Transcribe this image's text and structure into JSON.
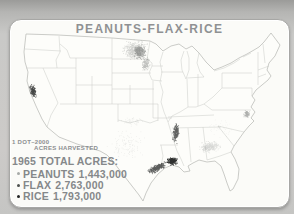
{
  "card": {
    "title": "PEANUTS-FLAX-RICE"
  },
  "legend": {
    "scale_line1": "1 DOT–2000",
    "scale_line2": "ACRES HARVESTED",
    "heading": "1965 TOTAL ACRES:",
    "items": [
      {
        "crop": "PEANUTS",
        "acres": "1,443,000",
        "bullet_color": "#a7aaa8"
      },
      {
        "crop": "FLAX",
        "acres": "2,763,000",
        "bullet_color": "#4e514f"
      },
      {
        "crop": "RICE",
        "acres": "1,793,000",
        "bullet_color": "#222423"
      }
    ]
  },
  "colors": {
    "background": "#c9c9c7",
    "card": "#fbfbf8",
    "card_border": "#a7a7a5",
    "title_text": "#8f9193",
    "legend_text": "#85888a",
    "map_outline": "#b4b6b2",
    "state_line": "#c8cac6"
  },
  "map": {
    "type": "dot-density",
    "region": "Continental United States",
    "dot_scale": {
      "dots": 1,
      "acres_per_dot": 2000
    },
    "year": "1965",
    "clusters": [
      {
        "name": "flax-north-dakota-core",
        "crop": "FLAX",
        "cx": 135,
        "cy": 50,
        "rx": 14,
        "ry": 11,
        "rot": 0,
        "count": 550,
        "r": 0.45,
        "color": "#6e716f",
        "opacity": 0.33,
        "seed": 1
      },
      {
        "name": "flax-red-river-dense",
        "crop": "FLAX",
        "cx": 140,
        "cy": 52,
        "rx": 7,
        "ry": 8,
        "rot": 0,
        "count": 260,
        "r": 0.5,
        "color": "#525553",
        "opacity": 0.45,
        "seed": 2
      },
      {
        "name": "flax-south-tail",
        "crop": "FLAX",
        "cx": 146,
        "cy": 64,
        "rx": 4.5,
        "ry": 9,
        "rot": 10,
        "count": 160,
        "r": 0.45,
        "color": "#646765",
        "opacity": 0.4,
        "seed": 3
      },
      {
        "name": "rice-california-valley",
        "crop": "RICE",
        "cx": 33,
        "cy": 91,
        "rx": 3.5,
        "ry": 7.5,
        "rot": -15,
        "count": 150,
        "r": 0.5,
        "color": "#1b1d1c",
        "opacity": 0.8,
        "seed": 4
      },
      {
        "name": "rice-gulf-coast-dense",
        "crop": "RICE",
        "cx": 172,
        "cy": 161,
        "rx": 6,
        "ry": 4.5,
        "rot": 0,
        "count": 230,
        "r": 0.55,
        "color": "#0f1110",
        "opacity": 0.85,
        "seed": 5
      },
      {
        "name": "rice-texas-coast",
        "crop": "RICE",
        "cx": 157,
        "cy": 168,
        "rx": 12,
        "ry": 4,
        "rot": -28,
        "count": 260,
        "r": 0.5,
        "color": "#1a1c1b",
        "opacity": 0.7,
        "seed": 6
      },
      {
        "name": "rice-arkansas-delta",
        "crop": "RICE",
        "cx": 176,
        "cy": 133,
        "rx": 3.8,
        "ry": 11.5,
        "rot": 8,
        "count": 190,
        "r": 0.5,
        "color": "#232524",
        "opacity": 0.72,
        "seed": 7
      },
      {
        "name": "peanuts-georgia-alabama",
        "crop": "PEANUTS",
        "cx": 210,
        "cy": 147,
        "rx": 12,
        "ry": 6.5,
        "rot": -8,
        "count": 300,
        "r": 0.4,
        "color": "#7a7d7b",
        "opacity": 0.3,
        "seed": 8
      },
      {
        "name": "peanuts-virginia-carolina",
        "crop": "PEANUTS",
        "cx": 247,
        "cy": 114,
        "rx": 4,
        "ry": 4.5,
        "rot": 0,
        "count": 90,
        "r": 0.45,
        "color": "#5c5f5d",
        "opacity": 0.5,
        "seed": 9
      },
      {
        "name": "peanuts-texas-scatter",
        "crop": "PEANUTS",
        "cx": 128,
        "cy": 144,
        "rx": 24,
        "ry": 18,
        "rot": 0,
        "count": 120,
        "r": 0.4,
        "color": "#8d908e",
        "opacity": 0.22,
        "seed": 10
      },
      {
        "name": "peanuts-oklahoma-scatter",
        "crop": "PEANUTS",
        "cx": 132,
        "cy": 121,
        "rx": 13,
        "ry": 6,
        "rot": 0,
        "count": 55,
        "r": 0.4,
        "color": "#8d908e",
        "opacity": 0.22,
        "seed": 11
      },
      {
        "name": "carolinas-light-scatter",
        "crop": "PEANUTS",
        "cx": 222,
        "cy": 128,
        "rx": 18,
        "ry": 12,
        "rot": 0,
        "count": 45,
        "r": 0.35,
        "color": "#9a9d9b",
        "opacity": 0.18,
        "seed": 12
      }
    ]
  }
}
